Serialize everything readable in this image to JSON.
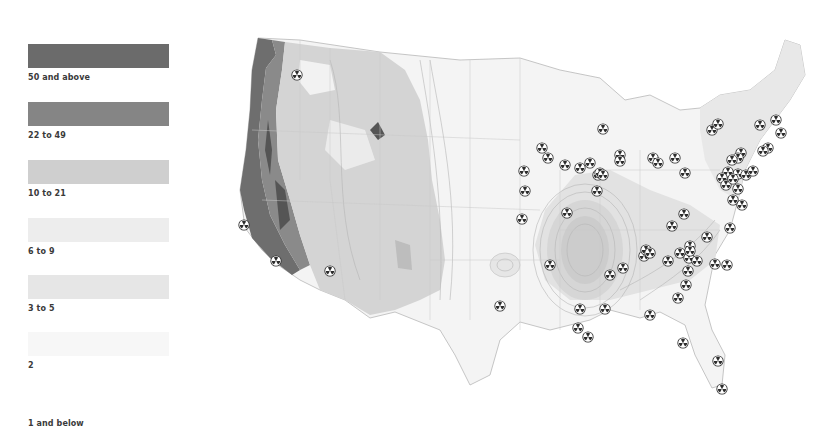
{
  "legend": {
    "items": [
      {
        "label": "50 and above",
        "color": "#6b6b6b"
      },
      {
        "label": "22 to 49",
        "color": "#858585"
      },
      {
        "label": "10 to 21",
        "color": "#cfcfcf"
      },
      {
        "label": "6 to 9",
        "color": "#ededed"
      },
      {
        "label": "3 to 5",
        "color": "#e6e6e6"
      },
      {
        "label": "2",
        "color": "#f7f7f7"
      },
      {
        "label": "1 and below",
        "color": "#ffffff"
      }
    ]
  },
  "map": {
    "region": "Contiguous United States",
    "marker_icon": "radiation-trefoil-icon",
    "marker_count": 78
  }
}
